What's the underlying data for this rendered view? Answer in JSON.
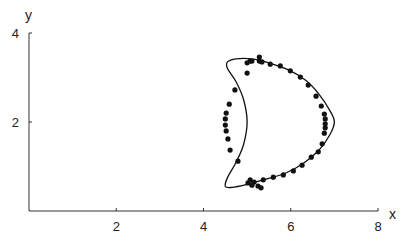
{
  "chart_data": {
    "type": "scatter",
    "title": "",
    "xlabel": "x",
    "ylabel": "y",
    "xlim": [
      0,
      8
    ],
    "ylim": [
      0,
      4
    ],
    "x_ticks": [
      2,
      4,
      6,
      8
    ],
    "y_ticks": [
      2,
      4
    ],
    "grid": false,
    "legend": null,
    "series": [
      {
        "name": "data points",
        "kind": "scatter",
        "points": [
          [
            5.0,
            3.33
          ],
          [
            5.07,
            3.37
          ],
          [
            5.11,
            3.37
          ],
          [
            5.28,
            3.46
          ],
          [
            5.28,
            3.37
          ],
          [
            5.34,
            3.35
          ],
          [
            5.53,
            3.3
          ],
          [
            5.76,
            3.26
          ],
          [
            5.99,
            3.15
          ],
          [
            6.22,
            3.01
          ],
          [
            6.4,
            2.83
          ],
          [
            6.58,
            2.58
          ],
          [
            6.7,
            2.36
          ],
          [
            6.77,
            2.18
          ],
          [
            6.79,
            2.07
          ],
          [
            6.79,
            1.96
          ],
          [
            6.79,
            1.87
          ],
          [
            6.77,
            1.75
          ],
          [
            6.72,
            1.51
          ],
          [
            6.63,
            1.33
          ],
          [
            6.47,
            1.21
          ],
          [
            6.26,
            1.03
          ],
          [
            6.06,
            0.9
          ],
          [
            5.83,
            0.81
          ],
          [
            5.6,
            0.76
          ],
          [
            5.37,
            0.7
          ],
          [
            5.25,
            0.56
          ],
          [
            5.16,
            0.65
          ],
          [
            5.11,
            0.58
          ],
          [
            5.07,
            0.7
          ],
          [
            5.02,
            0.63
          ],
          [
            5.32,
            0.52
          ],
          [
            5.0,
            3.1
          ],
          [
            4.72,
            2.72
          ],
          [
            4.59,
            2.4
          ],
          [
            4.52,
            2.2
          ],
          [
            4.5,
            2.07
          ],
          [
            4.5,
            1.93
          ],
          [
            4.52,
            1.8
          ],
          [
            4.56,
            1.62
          ],
          [
            4.61,
            1.37
          ],
          [
            4.79,
            1.12
          ]
        ]
      },
      {
        "name": "fitted curve",
        "kind": "line",
        "description": "closed crescent-shaped curve",
        "points": [
          [
            4.55,
            3.35
          ],
          [
            4.75,
            3.42
          ],
          [
            5.1,
            3.42
          ],
          [
            5.5,
            3.33
          ],
          [
            5.95,
            3.17
          ],
          [
            6.35,
            2.93
          ],
          [
            6.65,
            2.62
          ],
          [
            6.9,
            2.25
          ],
          [
            7.0,
            2.0
          ],
          [
            6.9,
            1.72
          ],
          [
            6.65,
            1.37
          ],
          [
            6.3,
            1.08
          ],
          [
            5.9,
            0.86
          ],
          [
            5.45,
            0.72
          ],
          [
            5.0,
            0.6
          ],
          [
            4.65,
            0.53
          ],
          [
            4.5,
            0.55
          ],
          [
            4.55,
            0.75
          ],
          [
            4.75,
            1.1
          ],
          [
            4.92,
            1.5
          ],
          [
            5.0,
            2.0
          ],
          [
            4.92,
            2.5
          ],
          [
            4.75,
            2.9
          ],
          [
            4.55,
            3.2
          ],
          [
            4.55,
            3.35
          ]
        ]
      }
    ]
  },
  "axes": {
    "x_label": "x",
    "y_label": "y",
    "x_tick_labels": [
      "2",
      "4",
      "6",
      "8"
    ],
    "y_tick_labels": [
      "2",
      "4"
    ]
  }
}
